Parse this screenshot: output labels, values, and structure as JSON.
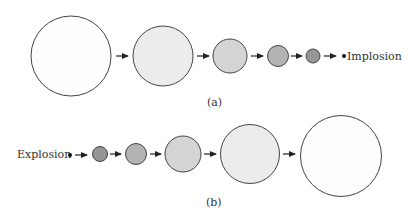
{
  "diagram": {
    "panel_a": {
      "caption": "(a)",
      "end_label": "Implosion",
      "circles": [
        {
          "cx": 71,
          "cy": 56,
          "r": 40,
          "fill": "#fdfdfd"
        },
        {
          "cx": 163,
          "cy": 56,
          "r": 30,
          "fill": "#ececec"
        },
        {
          "cx": 230,
          "cy": 56,
          "r": 17,
          "fill": "#d4d4d4"
        },
        {
          "cx": 278,
          "cy": 56,
          "r": 10.5,
          "fill": "#b3b3b3"
        },
        {
          "cx": 313,
          "cy": 56,
          "r": 7,
          "fill": "#969696"
        }
      ]
    },
    "panel_b": {
      "caption": "(b)",
      "start_label": "Explosion",
      "circles": [
        {
          "cx": 100,
          "cy": 154,
          "r": 7.5,
          "fill": "#969696"
        },
        {
          "cx": 136,
          "cy": 154,
          "r": 10.5,
          "fill": "#b3b3b3"
        },
        {
          "cx": 183,
          "cy": 154,
          "r": 18,
          "fill": "#d4d4d4"
        },
        {
          "cx": 250,
          "cy": 154,
          "r": 29.5,
          "fill": "#ececec"
        },
        {
          "cx": 341,
          "cy": 156,
          "r": 40.5,
          "fill": "#fdfdfd"
        }
      ]
    },
    "stroke_color": "#444444",
    "arrow_color": "#222222"
  }
}
